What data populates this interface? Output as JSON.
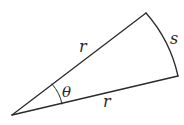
{
  "diagram": {
    "type": "circular-sector",
    "labels": {
      "radius_upper": "r",
      "radius_lower": "r",
      "arc": "s",
      "angle": "θ"
    },
    "colors": {
      "stroke": "#2a2a2a",
      "background": "#ffffff"
    }
  }
}
